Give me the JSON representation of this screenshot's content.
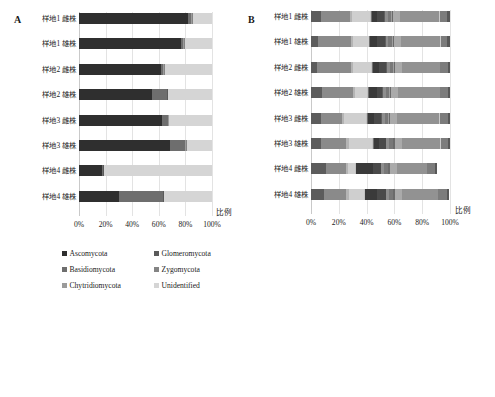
{
  "figure": {
    "panel_a_letter": "A",
    "panel_b_letter": "B",
    "axis_title": "比例"
  },
  "chart_data": [
    {
      "id": "A",
      "type": "bar",
      "orientation": "horizontal",
      "stacked": true,
      "stack_mode": "percent",
      "title": "A",
      "xlabel": "比例",
      "ylabel": "",
      "xlim": [
        0,
        100
      ],
      "xticks": [
        0,
        20,
        40,
        60,
        80,
        100
      ],
      "xticklabels": [
        "0%",
        "20%",
        "40%",
        "60%",
        "80%",
        "100%"
      ],
      "grid": true,
      "legend_position": "bottom",
      "categories": [
        "样地1 雌株",
        "样地1 雄株",
        "样地2 雌株",
        "样地2 雄株",
        "样地3 雌株",
        "样地3 雄株",
        "样地4 雌株",
        "样地4 雄株"
      ],
      "series": [
        {
          "name": "Ascomycota",
          "color": "#2f2f2f",
          "values": [
            82.0,
            76.5,
            62.0,
            55.0,
            62.5,
            68.5,
            17.0,
            30.0
          ]
        },
        {
          "name": "Basidiomycota",
          "color": "#6e6e6e",
          "values": [
            2.5,
            2.0,
            1.5,
            11.0,
            4.5,
            11.5,
            0.8,
            33.0
          ]
        },
        {
          "name": "Chytridiomycota",
          "color": "#9b9b9b",
          "values": [
            0.4,
            0.4,
            0.4,
            0.4,
            0.4,
            0.4,
            0.4,
            0.4
          ]
        },
        {
          "name": "Glomeromycota",
          "color": "#5a5a5a",
          "values": [
            0.3,
            0.3,
            0.3,
            0.3,
            0.3,
            0.3,
            0.3,
            0.3
          ]
        },
        {
          "name": "Zygomycota",
          "color": "#848484",
          "values": [
            0.3,
            0.3,
            0.3,
            0.3,
            0.3,
            0.3,
            0.3,
            0.3
          ]
        },
        {
          "name": "Unidentified",
          "color": "#d5d5d5",
          "values": [
            14.5,
            20.5,
            35.5,
            33.0,
            32.0,
            19.0,
            81.2,
            36.0
          ]
        }
      ],
      "legend": [
        {
          "label": "Ascomycota",
          "color": "#2f2f2f"
        },
        {
          "label": "Basidiomycota",
          "color": "#6e6e6e"
        },
        {
          "label": "Chytridiomycota",
          "color": "#9b9b9b"
        },
        {
          "label": "Glomeromycota",
          "color": "#5a5a5a"
        },
        {
          "label": "Zygomycota",
          "color": "#848484"
        },
        {
          "label": "Unidentified",
          "color": "#d5d5d5"
        }
      ]
    },
    {
      "id": "B",
      "type": "bar",
      "orientation": "horizontal",
      "stacked": true,
      "stack_mode": "percent",
      "title": "B",
      "xlabel": "比例",
      "ylabel": "",
      "xlim": [
        0,
        100
      ],
      "xticks": [
        0,
        20,
        40,
        60,
        80,
        100
      ],
      "xticklabels": [
        "0%",
        "20%",
        "40%",
        "60%",
        "80%",
        "100%"
      ],
      "grid": true,
      "legend_position": "bottom",
      "categories": [
        "样地1 雌株",
        "样地1 雄株",
        "样地2 雌株",
        "样地2 雄株",
        "样地3 雌株",
        "样地3 雄株",
        "样地4 雌株",
        "样地4 雄株"
      ],
      "series": [
        {
          "name": "Acidobacteria",
          "color": "#5c5c5c",
          "values": [
            7.0,
            5.0,
            4.0,
            8.0,
            7.0,
            7.5,
            11.0,
            9.5
          ]
        },
        {
          "name": "Actinobacteria",
          "color": "#8a8a8a",
          "values": [
            21.0,
            24.0,
            25.0,
            22.0,
            15.0,
            18.0,
            14.0,
            16.0
          ]
        },
        {
          "name": "Armatimonadetes",
          "color": "#b4b4b4",
          "values": [
            1.5,
            1.5,
            1.5,
            1.5,
            1.5,
            1.5,
            1.5,
            1.5
          ]
        },
        {
          "name": "Bacteroidetes",
          "color": "#cfcfcf",
          "values": [
            13.0,
            11.0,
            13.0,
            9.0,
            16.0,
            17.0,
            5.0,
            11.0
          ]
        },
        {
          "name": "Chlamydiae",
          "color": "#c2c2c2",
          "values": [
            0.6,
            0.6,
            0.6,
            0.6,
            0.6,
            0.6,
            0.6,
            0.6
          ]
        },
        {
          "name": "Chlorobi",
          "color": "#707070",
          "values": [
            0.6,
            0.6,
            0.6,
            0.6,
            0.6,
            0.6,
            0.6,
            0.6
          ]
        },
        {
          "name": "Chloroflexi",
          "color": "#3a3a3a",
          "values": [
            4.0,
            4.5,
            4.0,
            6.0,
            4.5,
            4.0,
            12.0,
            8.0
          ]
        },
        {
          "name": "Cyanobacteria",
          "color": "#4a4a4a",
          "values": [
            5.0,
            6.0,
            5.5,
            3.5,
            5.5,
            4.5,
            5.5,
            6.5
          ]
        },
        {
          "name": "Fibrobacteres",
          "color": "#5f5f5f",
          "values": [
            0.5,
            0.5,
            0.5,
            0.5,
            0.5,
            0.5,
            0.5,
            0.5
          ]
        },
        {
          "name": "Firmicutes",
          "color": "#8e8e8e",
          "values": [
            2.0,
            2.0,
            2.0,
            2.0,
            2.0,
            2.0,
            2.0,
            2.0
          ]
        },
        {
          "name": "Gemmatimonadetes",
          "color": "#787878",
          "values": [
            2.5,
            2.5,
            2.5,
            2.5,
            2.5,
            2.5,
            2.5,
            2.5
          ]
        },
        {
          "name": "Lentisphaerae",
          "color": "#9e9e9e",
          "values": [
            0.5,
            0.5,
            0.5,
            0.5,
            0.5,
            0.5,
            0.5,
            0.5
          ]
        },
        {
          "name": "Nitrospirae",
          "color": "#6a6a6a",
          "values": [
            1.0,
            1.0,
            1.0,
            1.0,
            1.0,
            1.0,
            1.0,
            1.0
          ]
        },
        {
          "name": "Planctomycetes",
          "color": "#aaaaaa",
          "values": [
            5.0,
            5.0,
            5.0,
            5.0,
            5.0,
            5.0,
            5.0,
            5.0
          ]
        },
        {
          "name": "Proteobacteria",
          "color": "#929292",
          "values": [
            28.0,
            28.5,
            27.0,
            30.0,
            30.0,
            28.0,
            21.5,
            26.0
          ]
        },
        {
          "name": "Tenericutes",
          "color": "#cacaca",
          "values": [
            0.4,
            0.4,
            0.4,
            0.4,
            0.4,
            0.4,
            0.4,
            0.4
          ]
        },
        {
          "name": "Verrucomicrobia",
          "color": "#7c7c7c",
          "values": [
            5.4,
            4.4,
            5.4,
            5.4,
            6.4,
            5.4,
            5.4,
            6.4
          ]
        },
        {
          "name": "Thermi",
          "color": "#585858",
          "values": [
            2.0,
            2.0,
            1.5,
            1.5,
            1.5,
            1.5,
            1.5,
            1.5
          ]
        }
      ],
      "legend": [
        {
          "label": "Acidobacteria",
          "color": "#5c5c5c"
        },
        {
          "label": "Actinobacteria",
          "color": "#8a8a8a"
        },
        {
          "label": "Armatimonadetes",
          "color": "#b4b4b4"
        },
        {
          "label": "Bacteroidetes",
          "color": "#cfcfcf"
        },
        {
          "label": "Chlamydiae",
          "color": "#c2c2c2"
        },
        {
          "label": "Chlorobi",
          "color": "#707070"
        },
        {
          "label": "Chloroflexi",
          "color": "#3a3a3a"
        },
        {
          "label": "Cyanobacteria",
          "color": "#4a4a4a"
        },
        {
          "label": "Fibrobacteres",
          "color": "#5f5f5f"
        },
        {
          "label": "Firmicutes",
          "color": "#8e8e8e"
        },
        {
          "label": "Gemmatimonadetes",
          "color": "#787878"
        },
        {
          "label": "Lentisphaerae",
          "color": "#9e9e9e"
        },
        {
          "label": "Nitrospirae",
          "color": "#6a6a6a"
        },
        {
          "label": "Planctomycetes",
          "color": "#aaaaaa"
        },
        {
          "label": "Proteobacteria",
          "color": "#929292"
        },
        {
          "label": "Tenericutes",
          "color": "#cacaca"
        },
        {
          "label": "Verrucomicrobia",
          "color": "#7c7c7c"
        },
        {
          "label": "Thermi",
          "color": "#585858"
        }
      ]
    }
  ]
}
